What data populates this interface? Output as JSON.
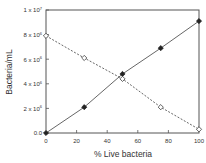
{
  "chart_data": {
    "type": "line",
    "title": "",
    "xlabel": "% Live bacteria",
    "ylabel": "Bacteria/mL",
    "x": [
      0,
      25,
      50,
      75,
      100
    ],
    "xlim": [
      0,
      100
    ],
    "ylim": [
      0,
      10000000
    ],
    "x_ticks": [
      "0",
      "20",
      "40",
      "60",
      "80",
      "100"
    ],
    "y_ticks": [
      "0.0",
      "2 x 10^6",
      "4 x 10^6",
      "6 x 10^6",
      "8 x 10^6",
      "1 x 10^7"
    ],
    "grid": false,
    "legend": "none",
    "series": [
      {
        "name": "Live (filled diamonds, solid line)",
        "marker": "filled-diamond",
        "line": "solid",
        "values": [
          0,
          2100000,
          4800000,
          6900000,
          9100000
        ]
      },
      {
        "name": "Dead (open diamonds, dashed line)",
        "marker": "open-diamond",
        "line": "dashed",
        "values": [
          7900000,
          6100000,
          4400000,
          2100000,
          300000
        ]
      }
    ]
  },
  "labels": {
    "xlabel": "% Live bacteria",
    "ylabel": "Bacteria/mL",
    "y0": "0.0",
    "y1_base": "2 x 10",
    "y2_base": "4 x 10",
    "y3_base": "6 x 10",
    "y4_base": "8 x 10",
    "y5_base": "1 x 10",
    "exp6": "6",
    "exp7": "7",
    "x0": "0",
    "x1": "20",
    "x2": "40",
    "x3": "60",
    "x4": "80",
    "x5": "100"
  },
  "colors": {
    "axis": "#555555",
    "series_line": "#555555",
    "marker": "#222222"
  }
}
